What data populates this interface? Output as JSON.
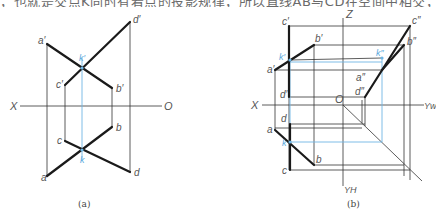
{
  "header": {
    "cropped_text": "，也就是交点K同时有着点的投影规律，所以直线AB与CD在空间中相交，求作K点的三面投影如图"
  },
  "figure_a": {
    "caption": "(a)",
    "axis_x": "X",
    "axis_o": "O",
    "labels": {
      "a_prime": "a′",
      "b_prime": "b′",
      "c_prime": "c′",
      "d_prime": "d′",
      "k_prime": "k′",
      "a": "a",
      "b": "b",
      "c": "c",
      "d": "d",
      "k": "k"
    }
  },
  "figure_b": {
    "caption": "(b)",
    "axis_x": "X",
    "axis_o": "O",
    "axis_z": "Z",
    "axis_yw": "Yw",
    "axis_yh": "YH",
    "labels": {
      "a_prime": "a′",
      "b_prime": "b′",
      "c_prime": "c′",
      "d_prime": "d′",
      "k_prime": "k′",
      "a_dprime": "a″",
      "b_dprime": "b″",
      "c_dprime": "c″",
      "d_dprime": "d″",
      "k_dprime": "k″",
      "a": "a",
      "b": "b",
      "c": "c",
      "d": "d",
      "k": "k"
    }
  },
  "colors": {
    "line": "#1a1a1a",
    "construction": "#333333",
    "highlight": "#6fb6e4"
  }
}
